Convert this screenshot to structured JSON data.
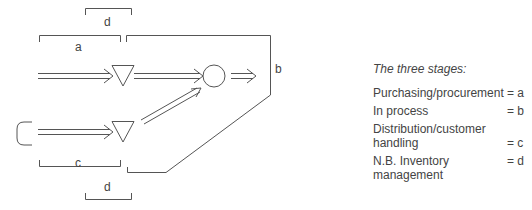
{
  "diagram": {
    "labels": {
      "top_d": "d",
      "a": "a",
      "b": "b",
      "c": "c",
      "bottom_d": "d"
    },
    "shapes": [
      "source-bracket",
      "inventory-triangle-top",
      "inventory-triangle-bottom",
      "process-circle"
    ],
    "line_color": "#555555"
  },
  "legend": {
    "title": "The three stages:",
    "rows": [
      {
        "label": "Purchasing/procurement",
        "value": "= a"
      },
      {
        "label": "In process",
        "value": "= b"
      },
      {
        "label": "Distribution/customer handling",
        "value": "= c"
      },
      {
        "label": "N.B. Inventory management",
        "value": "= d"
      }
    ]
  }
}
